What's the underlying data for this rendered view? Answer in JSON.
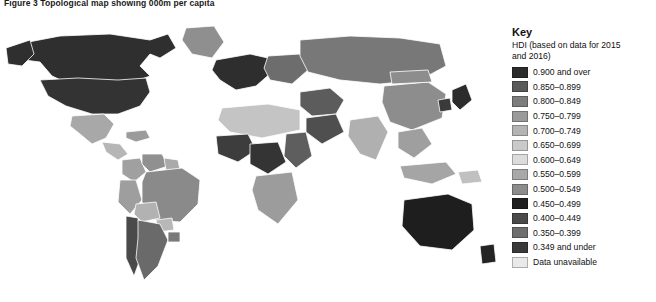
{
  "figure": {
    "caption": "Figure 3 Topological map showing 000m per capita"
  },
  "key": {
    "title": "Key",
    "subtitle": "HDI (based on data for 2015 and 2016)",
    "entries": [
      {
        "label": "0.900 and over",
        "color": "#2b2b2b"
      },
      {
        "label": "0.850–0.899",
        "color": "#5a5a5a"
      },
      {
        "label": "0.800–0.849",
        "color": "#7d7d7d"
      },
      {
        "label": "0.750–0.799",
        "color": "#9a9a9a"
      },
      {
        "label": "0.700–0.749",
        "color": "#b4b4b4"
      },
      {
        "label": "0.650–0.699",
        "color": "#c9c9c9"
      },
      {
        "label": "0.600–0.649",
        "color": "#dcdcdc"
      },
      {
        "label": "0.550–0.599",
        "color": "#a8a8a8"
      },
      {
        "label": "0.500–0.549",
        "color": "#8c8c8c"
      },
      {
        "label": "0.450–0.499",
        "color": "#1f1f1f"
      },
      {
        "label": "0.400–0.449",
        "color": "#4a4a4a"
      },
      {
        "label": "0.350–0.399",
        "color": "#6e6e6e"
      },
      {
        "label": "0.349 and under",
        "color": "#3a3a3a"
      },
      {
        "label": "Data unavailable",
        "color": "#e9e9e9"
      }
    ]
  },
  "map": {
    "type": "choropleth-cartogram",
    "background": "#ffffff",
    "ocean_color": "#ffffff",
    "border_color": "#ffffff",
    "regions": [
      {
        "name": "canada",
        "color": "#2f2f2f"
      },
      {
        "name": "alaska",
        "color": "#2f2f2f"
      },
      {
        "name": "greenland",
        "color": "#8f8f8f"
      },
      {
        "name": "united-states",
        "color": "#333333"
      },
      {
        "name": "mexico",
        "color": "#a8a8a8"
      },
      {
        "name": "central-america",
        "color": "#b6b6b6"
      },
      {
        "name": "caribbean",
        "color": "#9b9b9b"
      },
      {
        "name": "colombia",
        "color": "#a0a0a0"
      },
      {
        "name": "venezuela",
        "color": "#909090"
      },
      {
        "name": "brazil",
        "color": "#8a8a8a"
      },
      {
        "name": "peru",
        "color": "#9e9e9e"
      },
      {
        "name": "bolivia",
        "color": "#b2b2b2"
      },
      {
        "name": "chile",
        "color": "#4a4a4a"
      },
      {
        "name": "argentina",
        "color": "#6a6a6a"
      },
      {
        "name": "uruguay",
        "color": "#7a7a7a"
      },
      {
        "name": "paraguay",
        "color": "#b8b8b8"
      },
      {
        "name": "guyana-suriname",
        "color": "#aaaaaa"
      },
      {
        "name": "western-europe",
        "color": "#2e2e2e"
      },
      {
        "name": "eastern-europe",
        "color": "#6d6d6d"
      },
      {
        "name": "russia",
        "color": "#787878"
      },
      {
        "name": "north-africa",
        "color": "#c4c4c4"
      },
      {
        "name": "west-africa",
        "color": "#3d3d3d"
      },
      {
        "name": "central-africa",
        "color": "#343434"
      },
      {
        "name": "east-africa",
        "color": "#5e5e5e"
      },
      {
        "name": "southern-africa",
        "color": "#9c9c9c"
      },
      {
        "name": "middle-east",
        "color": "#5c5c5c"
      },
      {
        "name": "saudi-arabia",
        "color": "#4f4f4f"
      },
      {
        "name": "india",
        "color": "#b0b0b0"
      },
      {
        "name": "china",
        "color": "#8d8d8d"
      },
      {
        "name": "mongolia",
        "color": "#8d8d8d"
      },
      {
        "name": "southeast-asia",
        "color": "#9f9f9f"
      },
      {
        "name": "indonesia",
        "color": "#a5a5a5"
      },
      {
        "name": "japan",
        "color": "#2c2c2c"
      },
      {
        "name": "korea",
        "color": "#3a3a3a"
      },
      {
        "name": "australia",
        "color": "#1e1e1e"
      },
      {
        "name": "new-zealand",
        "color": "#242424"
      },
      {
        "name": "papua-new-guinea",
        "color": "#c0c0c0"
      }
    ]
  }
}
